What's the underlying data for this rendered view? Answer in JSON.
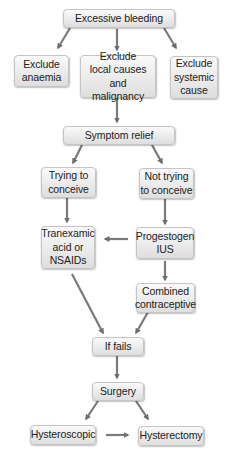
{
  "nodes": {
    "excessive_bleeding": "Excessive bleeding",
    "exclude_anaemia": "Exclude\nanaemia",
    "exclude_local": "Exclude\nlocal causes and\nmalignancy",
    "exclude_systemic": "Exclude\nsystemic\ncause",
    "symptom_relief": "Symptom relief",
    "trying_to_conceive": "Trying to\nconceive",
    "not_trying_to_conceive": "Not trying\nto conceive",
    "tranexamic": "Tranexamic\nacid or\nNSAIDs",
    "progestogen_ius": "Progestogen\nIUS",
    "combined_contraceptive": "Combined\ncontraceptive",
    "if_fails": "If fails",
    "surgery": "Surgery",
    "hysteroscopic": "Hysteroscopic",
    "hysterectomy": "Hysterectomy"
  },
  "edges": [
    [
      "excessive_bleeding",
      "exclude_anaemia"
    ],
    [
      "excessive_bleeding",
      "exclude_local"
    ],
    [
      "excessive_bleeding",
      "exclude_systemic"
    ],
    [
      "exclude_local",
      "symptom_relief"
    ],
    [
      "symptom_relief",
      "trying_to_conceive"
    ],
    [
      "symptom_relief",
      "not_trying_to_conceive"
    ],
    [
      "trying_to_conceive",
      "tranexamic"
    ],
    [
      "not_trying_to_conceive",
      "progestogen_ius"
    ],
    [
      "progestogen_ius",
      "tranexamic"
    ],
    [
      "progestogen_ius",
      "combined_contraceptive"
    ],
    [
      "tranexamic",
      "if_fails"
    ],
    [
      "combined_contraceptive",
      "if_fails"
    ],
    [
      "if_fails",
      "surgery"
    ],
    [
      "surgery",
      "hysteroscopic"
    ],
    [
      "surgery",
      "hysterectomy"
    ],
    [
      "hysteroscopic",
      "hysterectomy"
    ]
  ],
  "colors": {
    "arrow": "#6e6e6e",
    "box_border": "#c4c4c4",
    "box_fill_top": "#fafafa",
    "box_fill_bottom": "#dedede"
  }
}
